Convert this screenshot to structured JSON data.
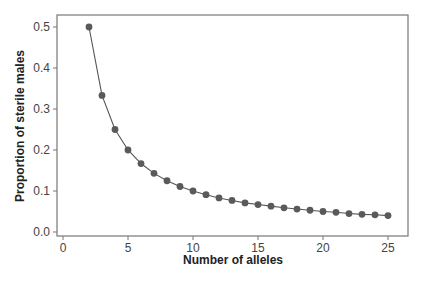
{
  "chart_data": {
    "type": "line",
    "title": "",
    "xlabel": "Number of alleles",
    "ylabel": "Proportion of sterile males",
    "xlim": [
      0,
      25
    ],
    "ylim": [
      0.0,
      0.5
    ],
    "xticks": [
      "0",
      "5",
      "10",
      "15",
      "20",
      "25"
    ],
    "yticks": [
      "0.0",
      "0.1",
      "0.2",
      "0.3",
      "0.4",
      "0.5"
    ],
    "grid": false,
    "legend": null,
    "series": [
      {
        "name": "Proportion of sterile males",
        "x": [
          2,
          3,
          4,
          5,
          6,
          7,
          8,
          9,
          10,
          11,
          12,
          13,
          14,
          15,
          16,
          17,
          18,
          19,
          20,
          21,
          22,
          23,
          24,
          25
        ],
        "values": [
          0.5,
          0.333,
          0.25,
          0.2,
          0.167,
          0.143,
          0.125,
          0.111,
          0.1,
          0.091,
          0.083,
          0.077,
          0.071,
          0.067,
          0.063,
          0.059,
          0.056,
          0.053,
          0.05,
          0.048,
          0.045,
          0.043,
          0.042,
          0.04
        ]
      }
    ],
    "colors": {
      "marker": "#5a5a5a",
      "line": "#555555",
      "axis": "#666666"
    }
  }
}
